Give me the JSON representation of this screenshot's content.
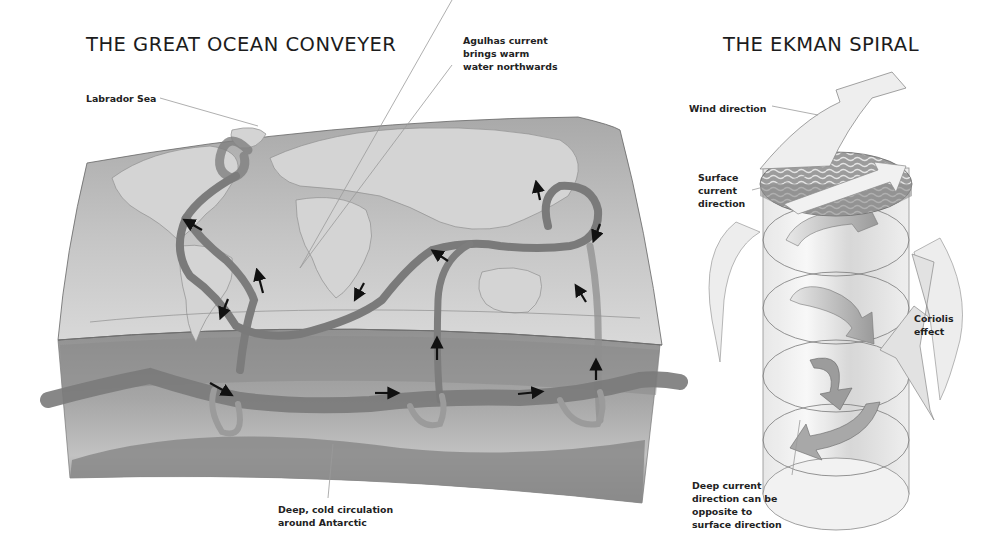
{
  "conveyer": {
    "title": "THE GREAT OCEAN CONVEYER",
    "labels": {
      "labrador_sea": "Labrador Sea",
      "agulhas": [
        "Agulhas current",
        "brings warm",
        "water northwards"
      ],
      "deep_cold": [
        "Deep, cold circulation",
        "around Antarctic"
      ]
    },
    "flow_arrows": [
      {
        "id": "atlantic-north-1",
        "direction": "up-left"
      },
      {
        "id": "atlantic-north-2",
        "direction": "up"
      },
      {
        "id": "atlantic-south",
        "direction": "down"
      },
      {
        "id": "indian-west",
        "direction": "down-left"
      },
      {
        "id": "indian-east",
        "direction": "up-left"
      },
      {
        "id": "pacific-north",
        "direction": "up"
      },
      {
        "id": "pacific-loop",
        "direction": "down"
      },
      {
        "id": "pacific-south",
        "direction": "up-left"
      },
      {
        "id": "antarctic-1",
        "direction": "down-right"
      },
      {
        "id": "antarctic-2",
        "direction": "right"
      },
      {
        "id": "antarctic-3",
        "direction": "right"
      },
      {
        "id": "indian-upwell",
        "direction": "up"
      },
      {
        "id": "pacific-upwell",
        "direction": "up"
      }
    ]
  },
  "ekman": {
    "title": "THE EKMAN SPIRAL",
    "labels": {
      "wind_direction": "Wind direction",
      "surface_current": [
        "Surface",
        "current",
        "direction"
      ],
      "coriolis": [
        "Coriolis",
        "effect"
      ],
      "deep_current": [
        "Deep current",
        "direction can be",
        "opposite to",
        "surface direction"
      ]
    }
  },
  "colors": {
    "background": "#ffffff",
    "land": "#c9c9c9",
    "ocean_top": "#b2b2b2",
    "ocean_face": "#8f8f8f",
    "current_band": "#7d7d7d",
    "arrow": "#111111",
    "leader_line": "#9a9a9a"
  }
}
